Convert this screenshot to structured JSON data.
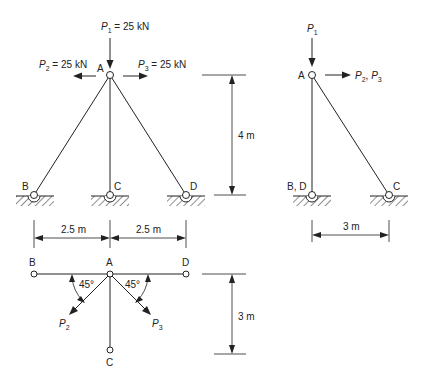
{
  "front_view": {
    "loads": {
      "p1": {
        "sym": "P",
        "sub": "1",
        "value": " = 25 kN"
      },
      "p2": {
        "sym": "P",
        "sub": "2",
        "value": " = 25 kN"
      },
      "p3": {
        "sym": "P",
        "sub": "3",
        "value": " = 25 kN"
      }
    },
    "nodes": {
      "a": "A",
      "b": "B",
      "c": "C",
      "d": "D"
    },
    "dims": {
      "height": "4 m",
      "span_left": "2.5 m",
      "span_right": "2.5 m"
    }
  },
  "side_view": {
    "loads": {
      "p1": {
        "sym": "P",
        "sub": "1"
      },
      "p23": {
        "sym1": "P",
        "sub1": "2",
        "sep": ", ",
        "sym2": "P",
        "sub2": "3"
      }
    },
    "nodes": {
      "a": "A",
      "bd": "B, D",
      "c": "C"
    },
    "dims": {
      "width": "3 m"
    }
  },
  "plan_view": {
    "nodes": {
      "a": "A",
      "b": "B",
      "c": "C",
      "d": "D"
    },
    "angles": {
      "left": "45°",
      "right": "45°"
    },
    "loads": {
      "p2": {
        "sym": "P",
        "sub": "2"
      },
      "p3": {
        "sym": "P",
        "sub": "3"
      }
    },
    "dims": {
      "depth": "3 m"
    }
  }
}
